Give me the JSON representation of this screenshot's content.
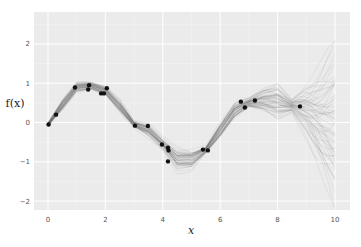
{
  "chart_data": {
    "type": "line",
    "title": "",
    "xlabel": "x",
    "ylabel": "f(x)",
    "xlim": [
      -0.5,
      10.5
    ],
    "ylim": [
      -2.3,
      2.7
    ],
    "grid": true,
    "legend": null,
    "x_ticks": [
      0,
      2,
      4,
      6,
      8,
      10
    ],
    "y_ticks": [
      -2,
      -1,
      0,
      1,
      2
    ],
    "x_tick_labels": [
      "0",
      "2",
      "4",
      "6",
      "8",
      "10"
    ],
    "y_tick_labels": [
      "−2",
      "−1",
      "0",
      "1",
      "2"
    ],
    "observations": {
      "name": "observed points",
      "color": "#111111",
      "x": [
        0.02,
        0.28,
        0.94,
        1.4,
        1.43,
        1.85,
        1.95,
        2.05,
        3.03,
        3.48,
        3.97,
        4.18,
        4.2,
        4.18,
        5.4,
        5.57,
        6.72,
        6.86,
        7.21,
        8.78
      ],
      "y": [
        -0.05,
        0.2,
        0.89,
        0.84,
        0.95,
        0.74,
        0.74,
        0.87,
        -0.08,
        -0.09,
        -0.56,
        -0.64,
        -0.71,
        -0.99,
        -0.69,
        -0.71,
        0.53,
        0.38,
        0.56,
        0.41
      ]
    },
    "posterior_mean": {
      "name": "GP posterior samples (mean curve)",
      "x": [
        0,
        0.5,
        1,
        1.5,
        2,
        2.5,
        3,
        3.5,
        4,
        4.5,
        5,
        5.5,
        6,
        6.5,
        7,
        7.5,
        8,
        8.5,
        9,
        9.5,
        10
      ],
      "y": [
        -0.05,
        0.45,
        0.9,
        0.93,
        0.8,
        0.4,
        -0.05,
        -0.2,
        -0.55,
        -0.95,
        -0.95,
        -0.7,
        -0.2,
        0.3,
        0.5,
        0.55,
        0.5,
        0.42,
        0.3,
        0.1,
        0.0
      ]
    },
    "posterior_spread": {
      "name": "approx sample spread (±)",
      "x": [
        0,
        0.5,
        1,
        1.5,
        2,
        2.5,
        3,
        3.5,
        4,
        4.5,
        5,
        5.5,
        6,
        6.5,
        7,
        7.5,
        8,
        8.5,
        9,
        9.5,
        10
      ],
      "y": [
        0.05,
        0.12,
        0.1,
        0.08,
        0.1,
        0.15,
        0.08,
        0.15,
        0.12,
        0.22,
        0.2,
        0.08,
        0.18,
        0.18,
        0.1,
        0.25,
        0.4,
        0.15,
        0.6,
        1.1,
        1.6
      ]
    },
    "n_samples": 60,
    "sample_color": "#555555"
  }
}
